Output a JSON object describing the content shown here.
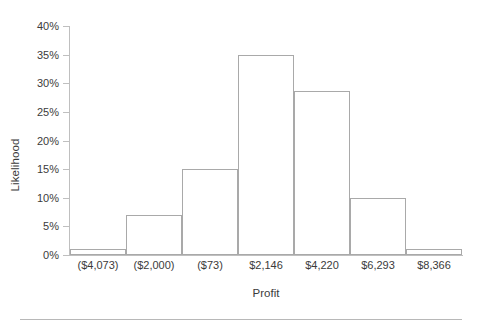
{
  "chart_data": {
    "type": "bar",
    "title": "",
    "xlabel": "Profit",
    "ylabel": "Likelihood",
    "categories": [
      "($4,073)",
      "($2,000)",
      "($73)",
      "$2,146",
      "$4,220",
      "$6,293",
      "$8,366"
    ],
    "values": [
      1.0,
      7.0,
      15.0,
      35.0,
      28.7,
      10.0,
      1.0
    ],
    "value_labels": [
      "1%",
      "7%",
      "15%",
      "35%",
      "28.7%",
      "10%",
      "1%"
    ],
    "ylim": [
      0,
      40
    ],
    "ytick_values": [
      0,
      5,
      10,
      15,
      20,
      25,
      30,
      35,
      40
    ],
    "ytick_labels": [
      "0%",
      "5%",
      "10%",
      "15%",
      "20%",
      "25%",
      "30%",
      "35%",
      "40%"
    ],
    "grid": false,
    "legend": null,
    "legend_position": "none",
    "bar_fill_color": "#ffffff",
    "bar_border_color": "#a9a9a9",
    "axis_color": "#bfbfbf",
    "text_color": "#3b3b3b"
  },
  "axis": {
    "y_title": "Likelihood",
    "x_title": "Profit"
  }
}
